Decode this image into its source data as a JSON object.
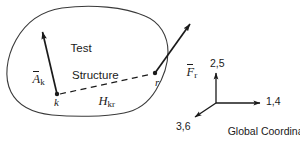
{
  "figure": {
    "kind": "free-body schematic of a test structure with global coordinate triad",
    "background_color": "#ffffff",
    "ink_color": "#1a1a1a"
  },
  "body": {
    "name": "test-structure-outline",
    "caption_line1": "Test",
    "caption_line2": "Structure"
  },
  "vectors": {
    "response": {
      "symbol_base": "A",
      "symbol_subscript": "k",
      "overbar": true,
      "from": {
        "x": 57,
        "y": 94
      },
      "to": {
        "x": 41,
        "y": 29
      }
    },
    "force": {
      "symbol_base": "F",
      "symbol_subscript": "r",
      "overbar": true,
      "from": {
        "x": 155,
        "y": 73
      },
      "to": {
        "x": 193,
        "y": 20
      }
    }
  },
  "transfer_path": {
    "label_base": "H",
    "label_subscript": "kr",
    "style": "dashed",
    "from": {
      "x": 57,
      "y": 94
    },
    "to": {
      "x": 155,
      "y": 73
    }
  },
  "points": {
    "k": {
      "label": "k",
      "x": 57,
      "y": 94
    },
    "r": {
      "label": "r",
      "x": 155,
      "y": 73
    }
  },
  "coordinate_triad": {
    "origin": {
      "x": 216,
      "y": 103
    },
    "axes": [
      {
        "name": "vertical-axis",
        "label": "2,5",
        "tip": {
          "x": 216,
          "y": 70
        }
      },
      {
        "name": "horizontal-axis",
        "label": "1,4",
        "tip": {
          "x": 263,
          "y": 103
        }
      },
      {
        "name": "oblique-axis",
        "label": "3,6",
        "tip": {
          "x": 192,
          "y": 119
        }
      }
    ],
    "caption_line1": "Global Coordinate",
    "caption_line2": "Directions"
  }
}
